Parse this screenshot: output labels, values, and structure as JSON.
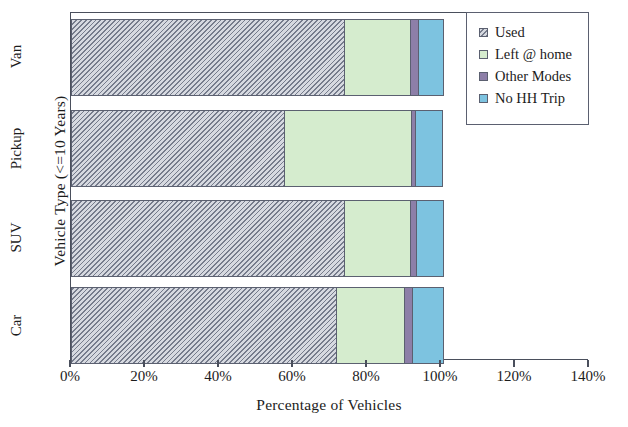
{
  "chart_data": {
    "type": "bar",
    "orientation": "horizontal",
    "stacked": true,
    "title": "",
    "xlabel": "Percentage of Vehicles",
    "ylabel": "Vehicle Type (<=10 Years)",
    "categories": [
      "Van",
      "Pickup",
      "SUV",
      "Car"
    ],
    "xlim": [
      0,
      140
    ],
    "xticks": [
      0,
      20,
      40,
      60,
      80,
      100,
      120,
      140
    ],
    "xtick_labels": [
      "0%",
      "20%",
      "40%",
      "60%",
      "80%",
      "100%",
      "120%",
      "140%"
    ],
    "grid": false,
    "legend_position": "top-right",
    "series": [
      {
        "name": "Used",
        "color": "#8b8f9c",
        "values": [
          73.8,
          57.6,
          73.8,
          71.6
        ]
      },
      {
        "name": "Left @ home",
        "color": "#d5ecce",
        "values": [
          17.8,
          34.3,
          17.8,
          18.4
        ]
      },
      {
        "name": "Other Modes",
        "color": "#8d7fa8",
        "values": [
          2.2,
          1.1,
          1.6,
          2.2
        ]
      },
      {
        "name": "No HH Trip",
        "color": "#7dc3e0",
        "values": [
          7.0,
          7.6,
          7.6,
          8.6
        ]
      }
    ]
  },
  "axes": {
    "y_title": "Vehicle Type (<=10 Years)",
    "x_title": "Percentage of Vehicles",
    "category_labels": [
      "Van",
      "Pickup",
      "SUV",
      "Car"
    ],
    "x_tick_labels": [
      "0%",
      "20%",
      "40%",
      "60%",
      "80%",
      "100%",
      "120%",
      "140%"
    ]
  },
  "legend": {
    "items": [
      {
        "label": "Used",
        "color": "#8b8f9c"
      },
      {
        "label": "Left @ home",
        "color": "#d5ecce"
      },
      {
        "label": "Other Modes",
        "color": "#8d7fa8"
      },
      {
        "label": "No HH Trip",
        "color": "#7dc3e0"
      }
    ]
  }
}
